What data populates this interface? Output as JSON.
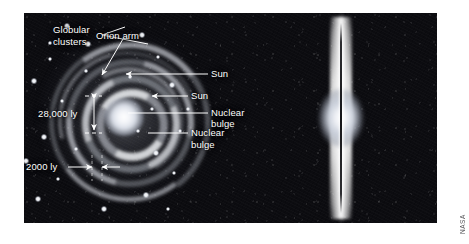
{
  "figure": {
    "background_color": "#0a0a0c",
    "credit": "NASA",
    "views": [
      {
        "id": "face-on",
        "name": "Face-on spiral view of the Milky Way"
      },
      {
        "id": "edge-on",
        "name": "Edge-on view of the Milky Way disk"
      }
    ]
  },
  "labels": {
    "orion_arm": "Orion arm",
    "sun_left": "Sun",
    "nuclear_bulge_left_line1": "Nuclear",
    "nuclear_bulge_left_line2": "bulge",
    "globular_line1": "Globular",
    "globular_line2": "clusters",
    "sun_right": "Sun",
    "nuclear_bulge_right_line1": "Nuclear",
    "nuclear_bulge_right_line2": "bulge"
  },
  "measurements": {
    "sun_distance": "28,000 ly",
    "disk_thickness": "2000 ly"
  },
  "colors": {
    "label_text": "#ffffff",
    "leader_line": "#ffffff",
    "sky": "#0c0c10",
    "credit_text": "#555558"
  },
  "globular_clusters": [
    {
      "x": 281,
      "y": 13,
      "r": 3.4
    },
    {
      "x": 302,
      "y": 31,
      "r": 2.6
    },
    {
      "x": 264,
      "y": 46,
      "r": 2.2
    },
    {
      "x": 356,
      "y": 22,
      "r": 3.0
    },
    {
      "x": 372,
      "y": 44,
      "r": 2.4
    },
    {
      "x": 248,
      "y": 68,
      "r": 2.6
    },
    {
      "x": 276,
      "y": 88,
      "r": 2.0
    },
    {
      "x": 386,
      "y": 72,
      "r": 2.6
    },
    {
      "x": 366,
      "y": 96,
      "r": 2.2
    },
    {
      "x": 232,
      "y": 104,
      "r": 2.4
    },
    {
      "x": 258,
      "y": 124,
      "r": 2.8
    },
    {
      "x": 394,
      "y": 118,
      "r": 2.4
    },
    {
      "x": 370,
      "y": 140,
      "r": 3.0
    },
    {
      "x": 240,
      "y": 148,
      "r": 2.6
    },
    {
      "x": 272,
      "y": 166,
      "r": 2.2
    },
    {
      "x": 388,
      "y": 160,
      "r": 2.4
    },
    {
      "x": 252,
      "y": 186,
      "r": 3.2
    },
    {
      "x": 360,
      "y": 182,
      "r": 2.6
    },
    {
      "x": 318,
      "y": 196,
      "r": 3.0
    },
    {
      "x": 300,
      "y": 58,
      "r": 1.8
    },
    {
      "x": 344,
      "y": 64,
      "r": 1.8
    },
    {
      "x": 290,
      "y": 136,
      "r": 1.8
    },
    {
      "x": 352,
      "y": 118,
      "r": 1.8
    },
    {
      "x": 226,
      "y": 62,
      "r": 1.8
    },
    {
      "x": 402,
      "y": 96,
      "r": 1.8
    },
    {
      "x": 264,
      "y": 30,
      "r": 1.6
    },
    {
      "x": 382,
      "y": 196,
      "r": 2.0
    },
    {
      "x": 236,
      "y": 172,
      "r": 1.8
    }
  ]
}
